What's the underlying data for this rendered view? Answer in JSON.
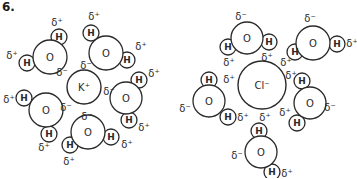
{
  "figure": {
    "number_label": "6.",
    "stroke_color": "#2a2a2a",
    "background": "#ffffff"
  },
  "clusters": [
    {
      "name": "potassium-hydration",
      "ion": {
        "label": "K⁺",
        "cx": 84,
        "cy": 87,
        "r": 17
      },
      "waters": [
        {
          "o": {
            "cx": 50,
            "cy": 57,
            "r": 17,
            "label": "O"
          },
          "h": [
            {
              "cx": 59,
              "cy": 37,
              "r": 8,
              "label": "H"
            },
            {
              "cx": 27,
              "cy": 63,
              "r": 8,
              "label": "H"
            }
          ],
          "charges": [
            {
              "x": 57,
              "y": 22,
              "label": "δ⁺"
            },
            {
              "x": 12,
              "y": 55,
              "label": "δ⁺"
            },
            {
              "x": 62,
              "y": 72,
              "label": "δ⁻"
            }
          ]
        },
        {
          "o": {
            "cx": 106,
            "cy": 53,
            "r": 17,
            "label": "O"
          },
          "h": [
            {
              "cx": 91,
              "cy": 33,
              "r": 8,
              "label": "H"
            },
            {
              "cx": 127,
              "cy": 60,
              "r": 8,
              "label": "H"
            }
          ],
          "charges": [
            {
              "x": 94,
              "y": 16,
              "label": "δ⁺"
            },
            {
              "x": 141,
              "y": 46,
              "label": "δ⁺"
            },
            {
              "x": 86,
              "y": 65,
              "label": "δ⁻"
            }
          ]
        },
        {
          "o": {
            "cx": 126,
            "cy": 98,
            "r": 16,
            "label": "O"
          },
          "h": [
            {
              "cx": 139,
              "cy": 80,
              "r": 8,
              "label": "H"
            },
            {
              "cx": 129,
              "cy": 120,
              "r": 8,
              "label": "H"
            }
          ],
          "charges": [
            {
              "x": 154,
              "y": 73,
              "label": "δ⁺"
            },
            {
              "x": 144,
              "y": 127,
              "label": "δ⁺"
            },
            {
              "x": 109,
              "y": 91,
              "label": "δ⁻"
            }
          ]
        },
        {
          "o": {
            "cx": 46,
            "cy": 110,
            "r": 17,
            "label": "O"
          },
          "h": [
            {
              "cx": 24,
              "cy": 98,
              "r": 8,
              "label": "H"
            },
            {
              "cx": 49,
              "cy": 134,
              "r": 8,
              "label": "H"
            }
          ],
          "charges": [
            {
              "x": 9,
              "y": 99,
              "label": "δ⁺"
            },
            {
              "x": 44,
              "y": 147,
              "label": "δ⁺"
            },
            {
              "x": 66,
              "y": 107,
              "label": "δ⁻"
            }
          ]
        },
        {
          "o": {
            "cx": 88,
            "cy": 132,
            "r": 17,
            "label": "O"
          },
          "h": [
            {
              "cx": 70,
              "cy": 145,
              "r": 8,
              "label": "H"
            },
            {
              "cx": 111,
              "cy": 137,
              "r": 8,
              "label": "H"
            }
          ],
          "charges": [
            {
              "x": 87,
              "y": 116,
              "label": "δ⁻"
            },
            {
              "x": 69,
              "y": 161,
              "label": "δ⁺"
            },
            {
              "x": 127,
              "y": 144,
              "label": "δ⁺"
            }
          ]
        }
      ]
    },
    {
      "name": "chloride-hydration",
      "ion": {
        "label": "Cl⁻",
        "cx": 262,
        "cy": 85,
        "r": 24
      },
      "waters": [
        {
          "o": {
            "cx": 247,
            "cy": 38,
            "r": 16,
            "label": "O"
          },
          "h": [
            {
              "cx": 228,
              "cy": 47,
              "r": 8,
              "label": "H"
            },
            {
              "cx": 269,
              "cy": 42,
              "r": 8,
              "label": "H"
            }
          ],
          "charges": [
            {
              "x": 241,
              "y": 16,
              "label": "δ⁻"
            },
            {
              "x": 229,
              "y": 62,
              "label": "δ⁺"
            },
            {
              "x": 267,
              "y": 57,
              "label": "δ⁺"
            }
          ]
        },
        {
          "o": {
            "cx": 313,
            "cy": 43,
            "r": 17,
            "label": "O"
          },
          "h": [
            {
              "cx": 295,
              "cy": 52,
              "r": 8,
              "label": "H"
            },
            {
              "cx": 337,
              "cy": 44,
              "r": 8,
              "label": "H"
            }
          ],
          "charges": [
            {
              "x": 310,
              "y": 18,
              "label": "δ⁻"
            },
            {
              "x": 286,
              "y": 62,
              "label": "δ⁺"
            },
            {
              "x": 352,
              "y": 43,
              "label": "δ⁺"
            }
          ]
        },
        {
          "o": {
            "cx": 209,
            "cy": 101,
            "r": 16,
            "label": "O"
          },
          "h": [
            {
              "cx": 209,
              "cy": 80,
              "r": 8,
              "label": "H"
            },
            {
              "cx": 228,
              "cy": 117,
              "r": 8,
              "label": "H"
            }
          ],
          "charges": [
            {
              "x": 185,
              "y": 108,
              "label": "δ⁻"
            },
            {
              "x": 229,
              "y": 79,
              "label": "δ⁺"
            },
            {
              "x": 243,
              "y": 117,
              "label": "δ⁺"
            }
          ]
        },
        {
          "o": {
            "cx": 310,
            "cy": 103,
            "r": 16,
            "label": "O"
          },
          "h": [
            {
              "cx": 302,
              "cy": 81,
              "r": 8,
              "label": "H"
            },
            {
              "cx": 297,
              "cy": 123,
              "r": 8,
              "label": "H"
            }
          ],
          "charges": [
            {
              "x": 330,
              "y": 107,
              "label": "δ⁻"
            },
            {
              "x": 291,
              "y": 75,
              "label": "δ⁺"
            },
            {
              "x": 285,
              "y": 112,
              "label": "δ⁺"
            }
          ]
        },
        {
          "o": {
            "cx": 261,
            "cy": 152,
            "r": 16,
            "label": "O"
          },
          "h": [
            {
              "cx": 259,
              "cy": 131,
              "r": 8,
              "label": "H"
            },
            {
              "cx": 272,
              "cy": 172,
              "r": 8,
              "label": "H"
            }
          ],
          "charges": [
            {
              "x": 265,
              "y": 117,
              "label": "δ⁺"
            },
            {
              "x": 237,
              "y": 155,
              "label": "δ⁻"
            },
            {
              "x": 287,
              "y": 173,
              "label": "δ⁺"
            }
          ]
        }
      ]
    }
  ]
}
